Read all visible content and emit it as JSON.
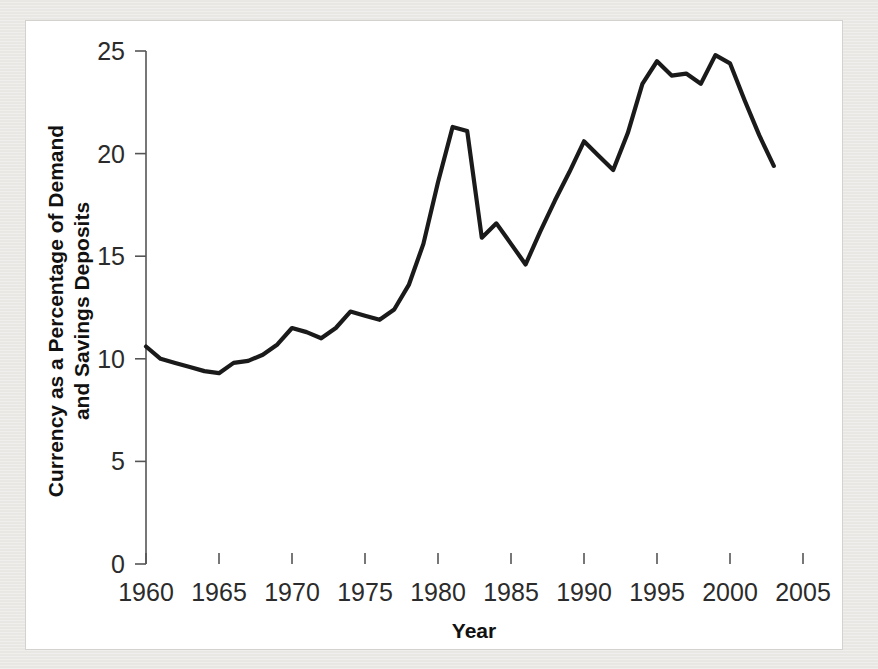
{
  "page": {
    "background_color": "#eceae7",
    "panel_color": "#ffffff",
    "panel_border_color": "#d4d2cf"
  },
  "chart_data": {
    "type": "line",
    "title": "",
    "subtitle": "",
    "xlabel": "Year",
    "ylabel": "Currency as a Percentage of Demand and Savings Deposits",
    "ylabel_line1": "Currency as a Percentage of Demand",
    "ylabel_line2": "and Savings Deposits",
    "xlim": [
      1959,
      2006.5
    ],
    "ylim": [
      0,
      25
    ],
    "xticks": [
      1960,
      1965,
      1970,
      1975,
      1980,
      1985,
      1990,
      1995,
      2000,
      2005
    ],
    "xtick_labels": [
      "1960",
      "1965",
      "1970",
      "1975",
      "1980",
      "1985",
      "1990",
      "1995",
      "2000",
      "2005"
    ],
    "yticks": [
      0,
      5,
      10,
      15,
      20,
      25
    ],
    "ytick_labels": [
      "0",
      "5",
      "10",
      "15",
      "20",
      "25"
    ],
    "grid": false,
    "legend": false,
    "legend_position": "none",
    "line_color": "#1a1a1a",
    "line_width": 4.2,
    "series": [
      {
        "name": "Currency as a Percentage of Demand and Savings Deposits",
        "x": [
          1960,
          1961,
          1962,
          1963,
          1964,
          1965,
          1966,
          1967,
          1968,
          1969,
          1970,
          1971,
          1972,
          1973,
          1974,
          1975,
          1976,
          1977,
          1978,
          1979,
          1980,
          1981,
          1982,
          1983,
          1984,
          1985,
          1986,
          1987,
          1988,
          1989,
          1990,
          1991,
          1992,
          1993,
          1994,
          1995,
          1996,
          1997,
          1998,
          1999,
          2000,
          2001,
          2002,
          2003
        ],
        "values": [
          10.6,
          10.0,
          9.8,
          9.6,
          9.4,
          9.3,
          9.8,
          9.9,
          10.2,
          10.7,
          11.5,
          11.3,
          11.0,
          11.5,
          12.3,
          12.1,
          11.9,
          12.4,
          13.6,
          15.6,
          18.6,
          21.3,
          21.1,
          15.9,
          16.6,
          15.6,
          14.6,
          16.2,
          17.7,
          19.1,
          20.6,
          19.9,
          19.2,
          21.0,
          23.4,
          24.5,
          23.8,
          23.9,
          23.4,
          24.8,
          24.4,
          22.6,
          20.9,
          19.4
        ]
      }
    ],
    "annotations": []
  }
}
